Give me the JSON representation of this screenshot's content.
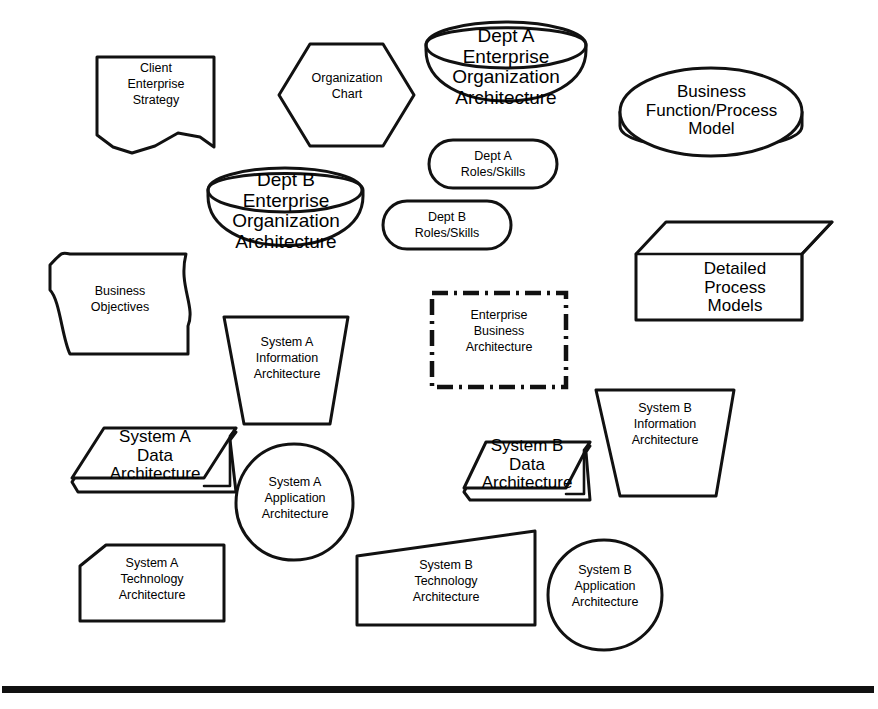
{
  "diagram": {
    "background_color": "#ffffff",
    "line_color": "#111111",
    "footer_rule": {
      "name": "horizontal-rule",
      "y": 688,
      "thickness": 7
    },
    "shapes": [
      {
        "id": "client-enterprise-strategy",
        "name": "client-enterprise-strategy-shape",
        "shape_type": "document-torn-bottom",
        "text": "Client\nEnterprise\nStrategy",
        "text_size": "small",
        "x": 95,
        "y": 55,
        "w": 120,
        "h": 96
      },
      {
        "id": "organization-chart",
        "name": "organization-chart-shape",
        "shape_type": "hexagon",
        "text": "Organization\nChart",
        "text_size": "small",
        "x": 277,
        "y": 42,
        "w": 138,
        "h": 106
      },
      {
        "id": "dept-a-enterprise-organization-architecture",
        "name": "dept-a-enterprise-organization-architecture-shape",
        "shape_type": "bowl",
        "text": "Dept A\nEnterprise\nOrganization\nArchitecture",
        "text_size": "big",
        "x": 423,
        "y": 22,
        "w": 165,
        "h": 118
      },
      {
        "id": "business-function-process-model",
        "name": "business-function-process-model-shape",
        "shape_type": "disc",
        "text": "Business\nFunction/Process\nModel",
        "text_size": "med",
        "x": 617,
        "y": 62,
        "w": 187,
        "h": 104
      },
      {
        "id": "dept-a-roles-skills",
        "name": "dept-a-roles-skills-shape",
        "shape_type": "stadium",
        "text": "Dept A\nRoles/Skills",
        "text_size": "small",
        "x": 427,
        "y": 138,
        "w": 132,
        "h": 52
      },
      {
        "id": "dept-b-enterprise-organization-architecture",
        "name": "dept-b-enterprise-organization-architecture-shape",
        "shape_type": "bowl",
        "text": "Dept B\nEnterprise\nOrganization\nArchitecture",
        "text_size": "big",
        "x": 205,
        "y": 168,
        "w": 160,
        "h": 100
      },
      {
        "id": "dept-b-roles-skills",
        "name": "dept-b-roles-skills-shape",
        "shape_type": "stadium",
        "text": "Dept B\nRoles/Skills",
        "text_size": "small",
        "x": 381,
        "y": 199,
        "w": 132,
        "h": 52
      },
      {
        "id": "detailed-process-models",
        "name": "detailed-process-models-shape",
        "shape_type": "open-box-3d",
        "text": "Detailed\nProcess\nModels",
        "text_size": "med",
        "x": 634,
        "y": 220,
        "w": 200,
        "h": 104
      },
      {
        "id": "business-objectives",
        "name": "business-objectives-shape",
        "shape_type": "wavy-card",
        "text": "Business\nObjectives",
        "text_size": "small",
        "x": 48,
        "y": 252,
        "w": 148,
        "h": 104
      },
      {
        "id": "system-a-information-architecture",
        "name": "system-a-information-architecture-shape",
        "shape_type": "inverted-trapezoid",
        "text": "System A\nInformation\nArchitecture",
        "text_size": "small",
        "x": 222,
        "y": 315,
        "w": 130,
        "h": 110
      },
      {
        "id": "enterprise-business-architecture",
        "name": "enterprise-business-architecture-shape",
        "shape_type": "dash-dot-rectangle",
        "text": "Enterprise\nBusiness\nArchitecture",
        "text_size": "small",
        "x": 429,
        "y": 290,
        "w": 140,
        "h": 100
      },
      {
        "id": "system-b-information-architecture",
        "name": "system-b-information-architecture-shape",
        "shape_type": "inverted-trapezoid",
        "text": "System B\nInformation\nArchitecture",
        "text_size": "small",
        "x": 592,
        "y": 388,
        "w": 146,
        "h": 110
      },
      {
        "id": "system-a-data-architecture",
        "name": "system-a-data-architecture-shape",
        "shape_type": "slab-3d",
        "text": "System A\nData\nArchitecture",
        "text_size": "med",
        "x": 70,
        "y": 420,
        "w": 168,
        "h": 80
      },
      {
        "id": "system-b-data-architecture",
        "name": "system-b-data-architecture-shape",
        "shape_type": "slab-3d",
        "text": "System B\nData\nArchitecture",
        "text_size": "med",
        "x": 462,
        "y": 430,
        "w": 130,
        "h": 70
      },
      {
        "id": "system-a-application-architecture",
        "name": "system-a-application-architecture-shape",
        "shape_type": "blob-circle",
        "text": "System A\nApplication\nArchitecture",
        "text_size": "small",
        "x": 235,
        "y": 442,
        "w": 118,
        "h": 118
      },
      {
        "id": "system-a-technology-architecture",
        "name": "system-a-technology-architecture-shape",
        "shape_type": "chamfered-rectangle",
        "text": "System A\nTechnology\nArchitecture",
        "text_size": "small",
        "x": 78,
        "y": 543,
        "w": 148,
        "h": 80
      },
      {
        "id": "system-b-technology-architecture",
        "name": "system-b-technology-architecture-shape",
        "shape_type": "slanted-top-quad",
        "text": "System B\nTechnology\nArchitecture",
        "text_size": "small",
        "x": 355,
        "y": 529,
        "w": 182,
        "h": 98
      },
      {
        "id": "system-b-application-architecture",
        "name": "system-b-application-architecture-shape",
        "shape_type": "blob-circle",
        "text": "System B\nApplication\nArchitecture",
        "text_size": "small",
        "x": 546,
        "y": 538,
        "w": 118,
        "h": 114
      }
    ]
  }
}
